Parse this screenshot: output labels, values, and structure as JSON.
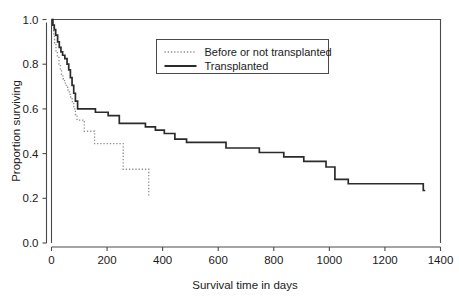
{
  "chart_data": {
    "type": "line",
    "subtype": "kaplan-meier-step",
    "title": "",
    "xlabel": "Survival time in days",
    "ylabel": "Proportion surviving",
    "xlim": [
      0,
      1400
    ],
    "ylim": [
      0.0,
      1.0
    ],
    "xticks": [
      0,
      200,
      400,
      600,
      800,
      1000,
      1200,
      1400
    ],
    "xtick_labels": [
      "0",
      "200",
      "400",
      "600",
      "800",
      "1000",
      "1200",
      "1400"
    ],
    "yticks": [
      0.0,
      0.2,
      0.4,
      0.6,
      0.8,
      1.0
    ],
    "ytick_labels": [
      "0.0",
      "0.2",
      "0.4",
      "0.6",
      "0.8",
      "1.0"
    ],
    "grid": false,
    "legend_position": "upper-center",
    "series": [
      {
        "name": "Before or not transplanted",
        "style": "dotted",
        "color": "#8d8d8d",
        "points": [
          [
            0,
            1.0
          ],
          [
            4,
            0.965
          ],
          [
            8,
            0.93
          ],
          [
            11,
            0.895
          ],
          [
            16,
            0.86
          ],
          [
            21,
            0.83
          ],
          [
            27,
            0.8
          ],
          [
            32,
            0.775
          ],
          [
            36,
            0.755
          ],
          [
            41,
            0.735
          ],
          [
            47,
            0.715
          ],
          [
            53,
            0.7
          ],
          [
            58,
            0.685
          ],
          [
            64,
            0.665
          ],
          [
            69,
            0.645
          ],
          [
            75,
            0.625
          ],
          [
            80,
            0.6
          ],
          [
            86,
            0.575
          ],
          [
            92,
            0.55
          ],
          [
            110,
            0.55
          ],
          [
            118,
            0.5
          ],
          [
            148,
            0.5
          ],
          [
            155,
            0.445
          ],
          [
            250,
            0.445
          ],
          [
            258,
            0.33
          ],
          [
            342,
            0.33
          ],
          [
            350,
            0.21
          ],
          [
            352,
            0.21
          ]
        ]
      },
      {
        "name": "Transplanted",
        "style": "solid",
        "color": "#2b2b2b",
        "points": [
          [
            0,
            1.0
          ],
          [
            5,
            0.975
          ],
          [
            10,
            0.955
          ],
          [
            15,
            0.93
          ],
          [
            22,
            0.9
          ],
          [
            28,
            0.875
          ],
          [
            34,
            0.855
          ],
          [
            40,
            0.84
          ],
          [
            48,
            0.825
          ],
          [
            56,
            0.8
          ],
          [
            62,
            0.775
          ],
          [
            68,
            0.74
          ],
          [
            74,
            0.705
          ],
          [
            80,
            0.67
          ],
          [
            86,
            0.635
          ],
          [
            94,
            0.6
          ],
          [
            150,
            0.6
          ],
          [
            158,
            0.585
          ],
          [
            196,
            0.585
          ],
          [
            204,
            0.57
          ],
          [
            236,
            0.57
          ],
          [
            244,
            0.535
          ],
          [
            330,
            0.535
          ],
          [
            338,
            0.52
          ],
          [
            366,
            0.52
          ],
          [
            374,
            0.505
          ],
          [
            398,
            0.505
          ],
          [
            406,
            0.49
          ],
          [
            436,
            0.49
          ],
          [
            444,
            0.465
          ],
          [
            478,
            0.465
          ],
          [
            486,
            0.45
          ],
          [
            620,
            0.45
          ],
          [
            628,
            0.425
          ],
          [
            740,
            0.425
          ],
          [
            748,
            0.405
          ],
          [
            828,
            0.405
          ],
          [
            836,
            0.385
          ],
          [
            900,
            0.385
          ],
          [
            908,
            0.365
          ],
          [
            980,
            0.365
          ],
          [
            988,
            0.34
          ],
          [
            1012,
            0.34
          ],
          [
            1020,
            0.285
          ],
          [
            1060,
            0.285
          ],
          [
            1068,
            0.265
          ],
          [
            1330,
            0.265
          ],
          [
            1338,
            0.235
          ],
          [
            1345,
            0.235
          ]
        ]
      }
    ],
    "legend": [
      {
        "label": "Before or not transplanted",
        "style": "dotted"
      },
      {
        "label": "Transplanted",
        "style": "solid"
      }
    ]
  }
}
